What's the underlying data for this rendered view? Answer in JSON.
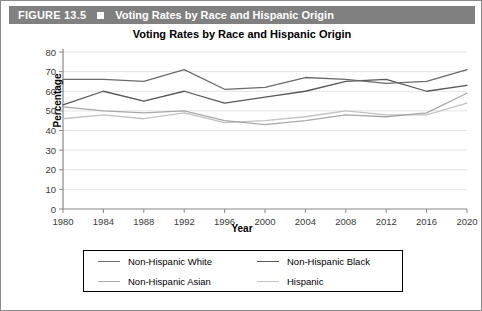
{
  "header": {
    "figure_label": "FIGURE 13.5",
    "marker_icon": "filled-square-icon",
    "title": "Voting Rates by Race and Hispanic Origin",
    "bar_color": "#808080",
    "text_color": "#ffffff"
  },
  "chart_data": {
    "type": "line",
    "title": "Voting Rates by Race and Hispanic Origin",
    "xlabel": "Year",
    "ylabel": "Percentage",
    "x": [
      1980,
      1984,
      1988,
      1992,
      1996,
      2000,
      2004,
      2008,
      2012,
      2016,
      2020
    ],
    "categories": [
      "1980",
      "1984",
      "1988",
      "1992",
      "1996",
      "2000",
      "2004",
      "2008",
      "2012",
      "2016",
      "2020"
    ],
    "xlim": [
      1980,
      2020
    ],
    "ylim": [
      0,
      80
    ],
    "yticks": [
      0,
      10,
      20,
      30,
      40,
      50,
      60,
      70,
      80
    ],
    "grid": true,
    "grid_axis": "y",
    "legend_position": "bottom",
    "series": [
      {
        "name": "Non-Hispanic White",
        "color": "#6b6b6b",
        "values": [
          66,
          66,
          65,
          71,
          61,
          62,
          67,
          66,
          64,
          65,
          71
        ]
      },
      {
        "name": "Non-Hispanic Black",
        "color": "#585858",
        "values": [
          53,
          60,
          55,
          60,
          54,
          57,
          60,
          65,
          66,
          60,
          63
        ]
      },
      {
        "name": "Non-Hispanic Asian",
        "color": "#a8a8a8",
        "values": [
          52,
          50,
          49,
          50,
          45,
          43,
          45,
          48,
          47,
          49,
          59
        ]
      },
      {
        "name": "Hispanic",
        "color": "#c2c2c2",
        "values": [
          46,
          48,
          46,
          49,
          44,
          45,
          47,
          50,
          48,
          48,
          54
        ]
      }
    ]
  },
  "legend": {
    "items": [
      {
        "label": "Non-Hispanic White",
        "color": "#6b6b6b"
      },
      {
        "label": "Non-Hispanic Black",
        "color": "#585858"
      },
      {
        "label": "Non-Hispanic Asian",
        "color": "#a8a8a8"
      },
      {
        "label": "Hispanic",
        "color": "#c2c2c2"
      }
    ]
  },
  "axis_style": {
    "line_color": "#888888",
    "grid_color": "#e4e4e4",
    "tick_label_color": "#3a3a3a"
  }
}
